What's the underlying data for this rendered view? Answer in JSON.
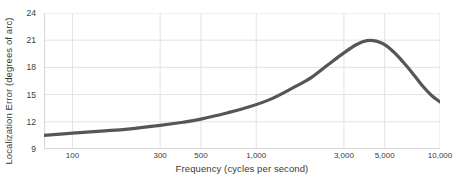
{
  "chart_data": {
    "type": "line",
    "title": "",
    "xlabel": "Frequency (cycles per second)",
    "ylabel": "Localization Error  (degrees of arc)",
    "xscale": "log",
    "xlim": [
      70,
      10000
    ],
    "ylim": [
      9,
      24
    ],
    "grid": true,
    "legend": "none",
    "x_ticks": [
      {
        "value": 100,
        "label": "100"
      },
      {
        "value": 300,
        "label": "300"
      },
      {
        "value": 500,
        "label": "500"
      },
      {
        "value": 1000,
        "label": "1,000"
      },
      {
        "value": 3000,
        "label": "3,000"
      },
      {
        "value": 5000,
        "label": "5,000"
      },
      {
        "value": 10000,
        "label": "10,000"
      }
    ],
    "y_ticks": [
      {
        "value": 9,
        "label": "9"
      },
      {
        "value": 12,
        "label": "12"
      },
      {
        "value": 15,
        "label": "15"
      },
      {
        "value": 18,
        "label": "18"
      },
      {
        "value": 21,
        "label": "21"
      },
      {
        "value": 24,
        "label": "24"
      }
    ],
    "series": [
      {
        "name": "Localization error",
        "color": "#565656",
        "line_width": 3.2,
        "x": [
          70,
          100,
          150,
          200,
          300,
          400,
          500,
          700,
          900,
          1200,
          1600,
          2000,
          2500,
          3000,
          3500,
          4000,
          4500,
          5000,
          5600,
          6300,
          7000,
          8000,
          9000,
          10000
        ],
        "y": [
          10.5,
          10.75,
          11.0,
          11.2,
          11.6,
          11.95,
          12.3,
          13.0,
          13.6,
          14.5,
          15.8,
          16.9,
          18.4,
          19.6,
          20.5,
          20.95,
          20.9,
          20.5,
          19.7,
          18.6,
          17.5,
          16.0,
          14.9,
          14.2
        ]
      }
    ]
  },
  "axis": {
    "y_title": "Localization Error  (degrees of arc)",
    "x_title": "Frequency (cycles per second)"
  },
  "colors": {
    "line": "#565656",
    "grid": "#e3e3e3",
    "axis": "#d8d8d8",
    "text": "#3a3a3a",
    "background": "#ffffff"
  }
}
